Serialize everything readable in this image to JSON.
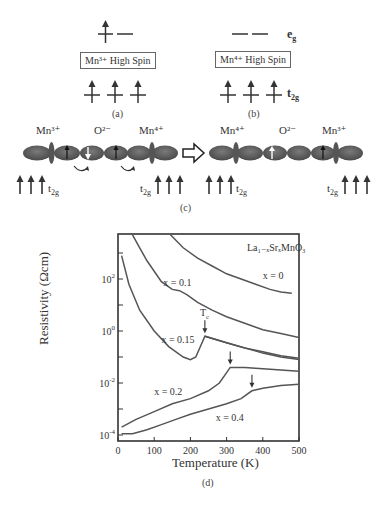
{
  "panel_a": {
    "box_label": "Mn³⁺ High Spin",
    "caption": "(a)"
  },
  "panel_b": {
    "box_label": "Mn⁴⁺ High Spin",
    "caption": "(b)"
  },
  "levels": {
    "eg": "e",
    "eg_sub": "g",
    "t2g": "t",
    "t2g_sub": "2g"
  },
  "panel_c": {
    "caption": "(c)",
    "left_chain": {
      "ions": [
        "Mn³⁺",
        "O²⁻",
        "Mn⁴⁺"
      ]
    },
    "right_chain": {
      "ions": [
        "Mn⁴⁺",
        "O²⁻",
        "Mn³⁺"
      ]
    },
    "t2g_label": "t",
    "t2g_sub": "2g"
  },
  "panel_d": {
    "caption": "(d)"
  },
  "chart_data": {
    "type": "line",
    "title": "La₁₋ₓSrₓMnO₃",
    "xlabel": "Temperature (K)",
    "ylabel": "Resistivity (Ωcm)",
    "xlim": [
      0,
      500
    ],
    "ylim_log10": [
      -4.2,
      3.7
    ],
    "yscale": "log",
    "x_ticks": [
      "0",
      "100",
      "200",
      "300",
      "400",
      "500"
    ],
    "y_ticks": [
      "10⁴",
      "10²",
      "10⁰",
      "10⁻²",
      "10⁻⁴"
    ],
    "y_tick_labels": [
      {
        "base": "10",
        "exp": "2"
      },
      {
        "base": "10",
        "exp": "0"
      },
      {
        "base": "10",
        "exp": "-2"
      },
      {
        "base": "10",
        "exp": "-4"
      }
    ],
    "grid": false,
    "annotation_tc": "T",
    "annotation_tc_sub": "c",
    "series": [
      {
        "name": "x = 0",
        "x": [
          430,
          480,
          520,
          560,
          600,
          640,
          690,
          720,
          750,
          780
        ],
        "note": "x in tenths-K placeholder not used"
      },
      {
        "name": "x = 0",
        "T": [
          145,
          180,
          220,
          260,
          300,
          340,
          380,
          420,
          450,
          480
        ],
        "log10_rho": [
          3.7,
          3.2,
          2.8,
          2.5,
          2.2,
          2.0,
          1.8,
          1.6,
          1.5,
          1.45
        ]
      },
      {
        "name": "x = 0.1",
        "T": [
          40,
          60,
          80,
          100,
          120,
          140,
          150,
          170,
          190,
          220,
          260,
          300,
          350,
          400,
          450,
          500
        ],
        "log10_rho": [
          3.7,
          3.2,
          2.7,
          2.3,
          1.9,
          1.7,
          1.6,
          1.55,
          1.4,
          1.1,
          0.8,
          0.55,
          0.3,
          0.05,
          -0.1,
          -0.25
        ]
      },
      {
        "name": "x = 0.15",
        "T": [
          10,
          30,
          60,
          100,
          140,
          180,
          200,
          215,
          240,
          300,
          350,
          400,
          450,
          500
        ],
        "log10_rho": [
          2.9,
          1.8,
          0.8,
          0.0,
          -0.6,
          -1.0,
          -1.1,
          -1.0,
          -0.2,
          -0.45,
          -0.65,
          -0.8,
          -0.95,
          -1.05
        ]
      },
      {
        "name": "x = 0.15 (lower branch)",
        "T": [
          240,
          300,
          350,
          400,
          450,
          500
        ],
        "log10_rho": [
          -0.2,
          -0.45,
          -0.65,
          -0.85,
          -1.0,
          -1.1
        ]
      },
      {
        "name": "x = 0.2",
        "T": [
          10,
          50,
          100,
          150,
          200,
          250,
          280,
          300,
          310,
          350,
          400,
          450,
          500
        ],
        "log10_rho": [
          -3.7,
          -3.4,
          -3.1,
          -2.8,
          -2.6,
          -2.3,
          -2.0,
          -1.6,
          -1.4,
          -1.4,
          -1.45,
          -1.5,
          -1.55
        ]
      },
      {
        "name": "x = 0.4",
        "T": [
          10,
          40,
          80,
          120,
          160,
          200,
          250,
          300,
          340,
          370,
          400,
          450,
          500
        ],
        "log10_rho": [
          -3.95,
          -3.95,
          -3.8,
          -3.6,
          -3.4,
          -3.2,
          -3.0,
          -2.8,
          -2.6,
          -2.3,
          -2.2,
          -2.1,
          -2.05
        ]
      }
    ],
    "tc_arrows_T": [
      240,
      310,
      370
    ],
    "curve_labels": [
      {
        "text": "x = 0",
        "T": 400,
        "log10": 2.0
      },
      {
        "text": "x = 0.1",
        "T": 125,
        "log10": 1.75
      },
      {
        "text": "x = 0.15",
        "T": 120,
        "log10": -0.45
      },
      {
        "text": "x = 0.2",
        "T": 100,
        "log10": -2.45
      },
      {
        "text": "x = 0.4",
        "T": 270,
        "log10": -3.45
      }
    ]
  }
}
